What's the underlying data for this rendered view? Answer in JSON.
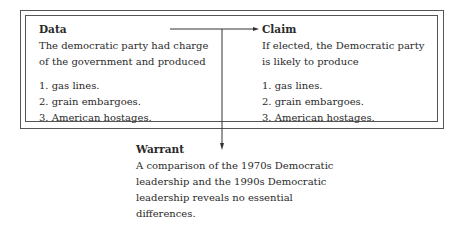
{
  "diagram": {
    "type": "toulmin-argument",
    "data": {
      "heading": "Data",
      "text_lines": [
        "The democratic party had charge",
        "of the government and produced"
      ],
      "items": [
        "1.  gas lines.",
        "2.  grain embargoes.",
        "3.  American hostages."
      ]
    },
    "claim": {
      "heading": "Claim",
      "text_lines": [
        "If elected, the Democratic party",
        "is likely to produce"
      ],
      "items": [
        "1.  gas lines.",
        "2.  grain embargoes.",
        "3.  American hostages."
      ]
    },
    "warrant": {
      "heading": "Warrant",
      "text_lines": [
        "A comparison of the 1970s Democratic",
        "leadership and the 1990s Democratic",
        "leadership reveals no essential",
        "differences."
      ]
    },
    "connections": [
      {
        "from": "data",
        "to": "claim"
      },
      {
        "from": "data-claim-link",
        "to": "warrant"
      }
    ]
  }
}
